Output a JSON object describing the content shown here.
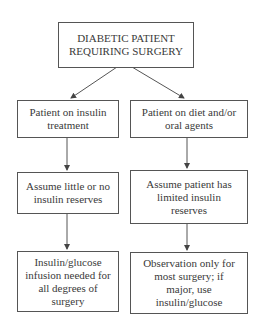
{
  "diagram": {
    "type": "flowchart",
    "root": {
      "id": "root",
      "text": "DIABETIC PATIENT REQUIRING SURGERY"
    },
    "branches": [
      {
        "name": "insulin",
        "nodes": [
          {
            "id": "l1",
            "text": "Patient on insulin treatment"
          },
          {
            "id": "l2",
            "text": "Assume little or no insulin reserves"
          },
          {
            "id": "l3",
            "text": "Insulin/glucose infusion needed for all degrees of surgery"
          }
        ]
      },
      {
        "name": "diet-oral",
        "nodes": [
          {
            "id": "r1",
            "text": "Patient on diet and/or oral agents"
          },
          {
            "id": "r2",
            "text": "Assume patient has limited insulin reserves"
          },
          {
            "id": "r3",
            "text": "Observation only for most surgery; if major, use insulin/glucose"
          }
        ]
      }
    ],
    "edges": [
      [
        "root",
        "l1"
      ],
      [
        "root",
        "r1"
      ],
      [
        "l1",
        "l2"
      ],
      [
        "l2",
        "l3"
      ],
      [
        "r1",
        "r2"
      ],
      [
        "r2",
        "r3"
      ]
    ],
    "colors": {
      "line": "#555555",
      "text": "#3a3a3a",
      "background": "#ffffff"
    }
  }
}
